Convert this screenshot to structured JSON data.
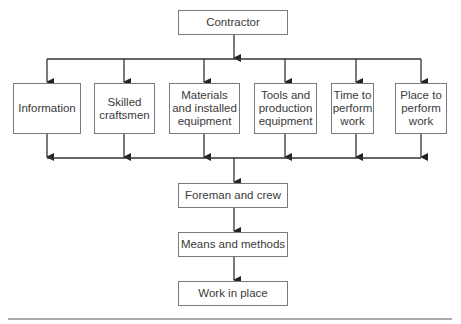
{
  "diagram": {
    "top": {
      "label": "Contractor"
    },
    "inputs": [
      {
        "label": "Information"
      },
      {
        "label": "Skilled craftsmen"
      },
      {
        "label": "Materials and installed equipment"
      },
      {
        "label": "Tools and production equipment"
      },
      {
        "label": "Time to perform work"
      },
      {
        "label": "Place to perform work"
      }
    ],
    "chain": [
      {
        "label": "Foreman and crew"
      },
      {
        "label": "Means and methods"
      },
      {
        "label": "Work in place"
      }
    ],
    "colors": {
      "line": "#333333",
      "border": "#7a7a7a",
      "text": "#3a3a3a"
    }
  }
}
